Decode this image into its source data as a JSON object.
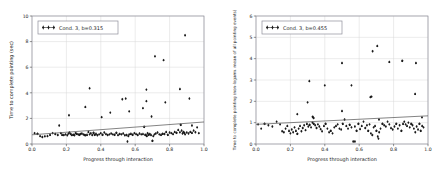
{
  "figure": {
    "name": "two-panel-scatter-figure",
    "background": "#ffffff",
    "marker_color": "#1a1a1a",
    "line_color": "#5b5b5b",
    "grid_color": "#d9d9d9",
    "frame_color": "#8f8f9a"
  },
  "chart_data": [
    {
      "type": "scatter",
      "panel": "left",
      "title": "",
      "xlabel": "Progress through interaction",
      "ylabel": "Time to complete pointing (sec)",
      "legend": [
        "Cond. 3, b=0.315"
      ],
      "legend_position": "upper left",
      "grid": true,
      "xlim": [
        0.0,
        1.0
      ],
      "ylim": [
        0,
        10
      ],
      "xticks": [
        "0.0",
        "0.2",
        "0.4",
        "0.6",
        "0.8",
        "1.0"
      ],
      "xtick_values": [
        0.0,
        0.2,
        0.4,
        0.6,
        0.8,
        1.0
      ],
      "yticks": [
        "0",
        "2",
        "4",
        "6",
        "8",
        "10"
      ],
      "ytick_values": [
        0,
        2,
        4,
        6,
        8,
        10
      ],
      "slope": 0.315,
      "fit_line": {
        "x": [
          0.0,
          1.0
        ],
        "y": [
          0.72,
          1.72
        ]
      },
      "x": [
        0.015,
        0.032,
        0.047,
        0.06,
        0.075,
        0.09,
        0.105,
        0.12,
        0.135,
        0.15,
        0.158,
        0.168,
        0.175,
        0.185,
        0.195,
        0.205,
        0.212,
        0.218,
        0.225,
        0.232,
        0.24,
        0.247,
        0.253,
        0.26,
        0.268,
        0.275,
        0.282,
        0.29,
        0.298,
        0.305,
        0.312,
        0.32,
        0.328,
        0.335,
        0.342,
        0.35,
        0.358,
        0.365,
        0.372,
        0.38,
        0.39,
        0.4,
        0.41,
        0.42,
        0.43,
        0.44,
        0.45,
        0.46,
        0.47,
        0.48,
        0.49,
        0.5,
        0.51,
        0.52,
        0.53,
        0.54,
        0.55,
        0.555,
        0.56,
        0.565,
        0.575,
        0.585,
        0.595,
        0.605,
        0.615,
        0.625,
        0.635,
        0.645,
        0.652,
        0.658,
        0.663,
        0.668,
        0.672,
        0.678,
        0.685,
        0.692,
        0.7,
        0.705,
        0.712,
        0.72,
        0.73,
        0.74,
        0.75,
        0.76,
        0.77,
        0.78,
        0.79,
        0.8,
        0.81,
        0.82,
        0.83,
        0.84,
        0.85,
        0.86,
        0.865,
        0.87,
        0.875,
        0.88,
        0.885,
        0.89,
        0.9,
        0.91,
        0.92,
        0.93,
        0.94,
        0.95,
        0.96,
        0.97,
        0.215,
        0.31,
        0.335,
        0.405,
        0.455,
        0.525,
        0.545,
        0.565,
        0.645,
        0.665,
        0.665,
        0.695,
        0.715,
        0.765,
        0.775,
        0.86,
        0.89,
        0.915,
        0.93
      ],
      "y": [
        0.85,
        0.8,
        0.62,
        0.55,
        0.6,
        0.62,
        0.72,
        0.85,
        0.78,
        0.7,
        1.45,
        0.85,
        0.72,
        0.7,
        0.75,
        0.68,
        0.82,
        0.9,
        0.78,
        0.7,
        0.72,
        0.68,
        0.85,
        0.8,
        0.75,
        0.72,
        0.78,
        0.82,
        0.75,
        0.7,
        0.68,
        0.72,
        0.95,
        0.75,
        0.85,
        0.7,
        0.88,
        0.72,
        0.8,
        0.68,
        0.75,
        0.85,
        0.72,
        0.9,
        0.78,
        0.7,
        0.75,
        0.82,
        0.75,
        0.72,
        0.88,
        0.7,
        0.78,
        0.75,
        0.82,
        0.68,
        0.7,
        0.2,
        0.62,
        0.75,
        0.8,
        0.72,
        0.85,
        0.78,
        0.7,
        0.82,
        0.75,
        0.78,
        1.35,
        0.72,
        0.68,
        0.62,
        0.85,
        0.72,
        0.78,
        0.7,
        0.25,
        0.62,
        0.75,
        0.82,
        0.9,
        0.75,
        0.72,
        0.8,
        0.78,
        0.95,
        0.72,
        0.9,
        0.85,
        0.78,
        0.95,
        0.88,
        1.1,
        0.92,
        1.5,
        1.05,
        0.82,
        0.95,
        0.88,
        0.75,
        0.9,
        0.82,
        0.95,
        0.88,
        1.05,
        0.92,
        1.3,
        0.85,
        2.25,
        2.9,
        4.35,
        2.1,
        2.45,
        3.5,
        3.55,
        2.55,
        2.8,
        3.35,
        4.25,
        2.15,
        6.85,
        6.55,
        3.25,
        4.3,
        8.5,
        3.55,
        1.45
      ]
    },
    {
      "type": "scatter",
      "panel": "right",
      "title": "",
      "xlabel": "Progress through interaction",
      "ylabel": "Time to complete pointing (non-logarm. mean of all pointing events)",
      "legend": [
        "Cond. 3, b=0.455"
      ],
      "legend_position": "upper left",
      "grid": true,
      "xlim": [
        0.0,
        1.0
      ],
      "ylim": [
        0,
        6
      ],
      "xticks": [
        "0.0",
        "0.2",
        "0.4",
        "0.6",
        "0.8",
        "1.0"
      ],
      "xtick_values": [
        0.0,
        0.2,
        0.4,
        0.6,
        0.8,
        1.0
      ],
      "yticks": [
        "0",
        "1",
        "2",
        "3",
        "4",
        "5",
        "6"
      ],
      "ytick_values": [
        0,
        1,
        2,
        3,
        4,
        5,
        6
      ],
      "slope": 0.455,
      "fit_line": {
        "x": [
          0.0,
          1.0
        ],
        "y": [
          0.92,
          1.32
        ]
      },
      "x": [
        0.012,
        0.03,
        0.05,
        0.072,
        0.095,
        0.12,
        0.14,
        0.152,
        0.162,
        0.172,
        0.182,
        0.192,
        0.2,
        0.208,
        0.216,
        0.224,
        0.232,
        0.24,
        0.248,
        0.256,
        0.264,
        0.272,
        0.28,
        0.288,
        0.296,
        0.304,
        0.312,
        0.32,
        0.328,
        0.336,
        0.344,
        0.352,
        0.36,
        0.368,
        0.376,
        0.384,
        0.395,
        0.405,
        0.415,
        0.425,
        0.435,
        0.445,
        0.455,
        0.465,
        0.475,
        0.485,
        0.495,
        0.505,
        0.515,
        0.525,
        0.535,
        0.545,
        0.555,
        0.565,
        0.575,
        0.585,
        0.595,
        0.605,
        0.615,
        0.625,
        0.635,
        0.645,
        0.652,
        0.66,
        0.668,
        0.676,
        0.684,
        0.692,
        0.7,
        0.708,
        0.716,
        0.724,
        0.735,
        0.745,
        0.755,
        0.765,
        0.775,
        0.785,
        0.795,
        0.805,
        0.815,
        0.825,
        0.835,
        0.845,
        0.855,
        0.862,
        0.87,
        0.878,
        0.886,
        0.894,
        0.902,
        0.91,
        0.918,
        0.926,
        0.934,
        0.942,
        0.95,
        0.958,
        0.966,
        0.974,
        0.24,
        0.3,
        0.31,
        0.33,
        0.335,
        0.4,
        0.5,
        0.5,
        0.555,
        0.575,
        0.665,
        0.672,
        0.678,
        0.705,
        0.712,
        0.715,
        0.775,
        0.85,
        0.925,
        0.93,
        0.965
      ],
      "y": [
        0.92,
        0.72,
        0.95,
        0.88,
        0.82,
        1.05,
        0.92,
        0.6,
        0.55,
        0.72,
        0.85,
        0.62,
        0.5,
        0.68,
        0.55,
        0.78,
        0.62,
        0.48,
        0.72,
        0.85,
        0.6,
        0.75,
        0.88,
        0.65,
        0.95,
        0.82,
        0.9,
        0.78,
        1.0,
        0.95,
        0.88,
        0.75,
        0.92,
        0.82,
        0.7,
        0.6,
        0.85,
        0.95,
        0.72,
        0.55,
        0.62,
        0.5,
        0.78,
        0.85,
        0.92,
        0.72,
        0.68,
        0.95,
        1.15,
        0.85,
        0.72,
        0.9,
        0.78,
        0.12,
        0.82,
        0.62,
        0.95,
        0.7,
        0.85,
        1.05,
        0.75,
        0.88,
        0.62,
        0.92,
        0.5,
        0.42,
        0.78,
        0.85,
        0.62,
        0.35,
        0.55,
        0.72,
        0.95,
        0.88,
        0.82,
        1.05,
        0.92,
        0.75,
        0.68,
        0.82,
        0.95,
        0.72,
        0.88,
        0.62,
        0.95,
        1.05,
        0.92,
        0.85,
        1.0,
        0.78,
        0.95,
        0.88,
        0.72,
        0.55,
        0.82,
        0.68,
        0.95,
        0.62,
        0.85,
        0.78,
        1.4,
        1.95,
        2.95,
        1.28,
        1.22,
        2.75,
        3.8,
        1.55,
        2.75,
        0.12,
        2.2,
        2.22,
        4.35,
        4.6,
        0.25,
        1.15,
        3.85,
        3.9,
        2.35,
        3.8,
        1.25
      ]
    }
  ]
}
